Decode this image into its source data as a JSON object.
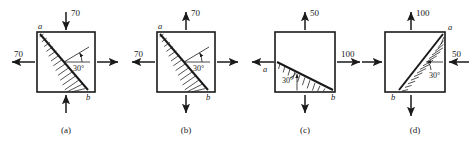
{
  "figure": {
    "type": "stress-element-diagram-set",
    "panel_count": 4,
    "angle_label": "30°",
    "plane_labels": {
      "top": "a",
      "bottom": "b"
    },
    "stroke_color": "#1a1a1a",
    "background_color": "#ffffff"
  },
  "panels": [
    {
      "id": "a",
      "caption": "(a)",
      "cut_plane": {
        "from": "top-left-corner",
        "to": "bottom-right-corner",
        "label_start": "a",
        "label_end": "b",
        "hatch_side": "left",
        "angle": "30°"
      },
      "loads": {
        "top": {
          "value": "70",
          "direction": "down",
          "sense": "compression"
        },
        "bottom": {
          "value": "",
          "direction": "up",
          "sense": "compression"
        },
        "left": {
          "value": "70",
          "direction": "left",
          "sense": "tension"
        },
        "right": {
          "value": "",
          "direction": "right",
          "sense": "tension"
        }
      }
    },
    {
      "id": "b",
      "caption": "(b)",
      "cut_plane": {
        "from": "top-left-corner",
        "to": "bottom-right-corner",
        "label_start": "a",
        "label_end": "b",
        "hatch_side": "left",
        "angle": "30°"
      },
      "loads": {
        "top": {
          "value": "70",
          "direction": "up",
          "sense": "tension"
        },
        "bottom": {
          "value": "",
          "direction": "down",
          "sense": "tension"
        },
        "left": {
          "value": "70",
          "direction": "left",
          "sense": "tension"
        },
        "right": {
          "value": "",
          "direction": "right",
          "sense": "tension"
        }
      }
    },
    {
      "id": "c",
      "caption": "(c)",
      "cut_plane": {
        "from": "left-edge-midpoint",
        "to": "bottom-right-corner",
        "label_start": "a",
        "label_end": "b",
        "hatch_side": "below",
        "angle": "30°"
      },
      "loads": {
        "top": {
          "value": "50",
          "direction": "up",
          "sense": "tension"
        },
        "bottom": {
          "value": "",
          "direction": "down",
          "sense": "tension"
        },
        "left": {
          "value": "",
          "direction": "left",
          "sense": "tension"
        },
        "right": {
          "value": "100",
          "direction": "right",
          "sense": "tension"
        }
      }
    },
    {
      "id": "d",
      "caption": "(d)",
      "cut_plane": {
        "from": "bottom-edge-point",
        "to": "top-right-corner",
        "label_start": "a",
        "label_end": "b",
        "hatch_side": "upper-right",
        "angle": "30°"
      },
      "loads": {
        "top": {
          "value": "100",
          "direction": "up",
          "sense": "tension"
        },
        "bottom": {
          "value": "",
          "direction": "down",
          "sense": "tension"
        },
        "left": {
          "value": "",
          "direction": "right",
          "sense": "compression"
        },
        "right": {
          "value": "50",
          "direction": "left",
          "sense": "compression"
        }
      }
    }
  ]
}
